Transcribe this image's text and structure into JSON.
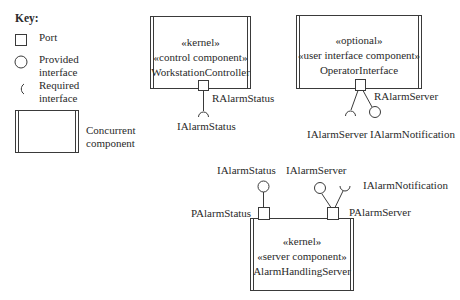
{
  "key": {
    "title": "Key:",
    "items": [
      {
        "symbol": "port-square",
        "label": "Port"
      },
      {
        "symbol": "provided-interface-circle",
        "label_line1": "Provided",
        "label_line2": "interface"
      },
      {
        "symbol": "required-interface-arc",
        "label_line1": "Required",
        "label_line2": "interface"
      },
      {
        "symbol": "concurrent-component-box",
        "label_line1": "Concurrent",
        "label_line2": "component"
      }
    ]
  },
  "components": {
    "workstation_controller": {
      "stereotype1": "«kernel»",
      "stereotype2": "«control component»",
      "name": "WorkstationController",
      "port": "RAlarmStatus",
      "required": [
        "IAlarmStatus"
      ]
    },
    "operator_interface": {
      "stereotype1": "«optional»",
      "stereotype2": "«user interface component»",
      "name": "OperatorInterface",
      "port": "RAlarmServer",
      "required": [
        "IAlarmServer"
      ],
      "provided": [
        "IAlarmNotification"
      ]
    },
    "alarm_handling_server": {
      "stereotype1": "«kernel»",
      "stereotype2": "«server component»",
      "name": "AlarmHandlingServer",
      "port_left": "PAlarmStatus",
      "port_right": "PAlarmServer",
      "provided_left": "IAlarmStatus",
      "provided_right": "IAlarmServer",
      "required_right": "IAlarmNotification"
    }
  },
  "colors": {
    "line": "#3a3a3a",
    "background": "#ffffff"
  }
}
